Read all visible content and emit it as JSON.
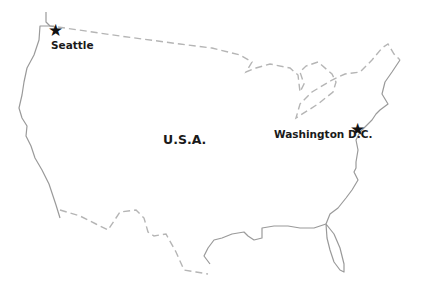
{
  "map": {
    "country_label": "U.S.A.",
    "cities": [
      {
        "name": "Seattle",
        "marker": "star-icon"
      },
      {
        "name": "Washington D.C.",
        "marker": "star-icon"
      }
    ],
    "star_glyph": "★",
    "colors": {
      "coastline": "#9a9a9a",
      "border": "#b5b5b5",
      "text": "#1a1a1a",
      "marker": "#111111"
    }
  }
}
